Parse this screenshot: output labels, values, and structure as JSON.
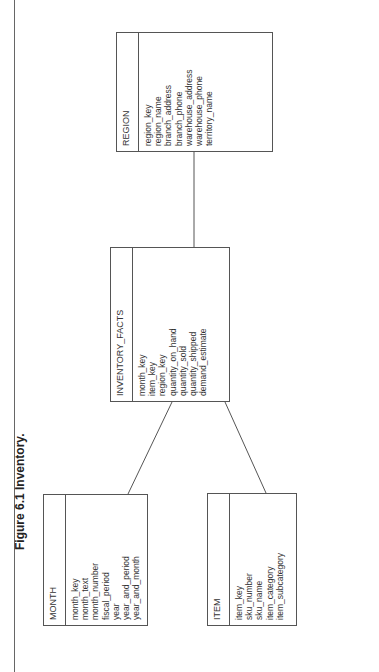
{
  "figure": {
    "title": "Figure 6.1 Inventory."
  },
  "entities": {
    "month": {
      "name": "MONTH",
      "attributes": [
        "month_key",
        "month_text",
        "month_number",
        "fiscal_period",
        "year",
        "year_and_period",
        "year_and_month"
      ]
    },
    "item": {
      "name": "ITEM",
      "attributes": [
        "item_key",
        "sku_number",
        "sku_name",
        "item_category",
        "item_subcategory"
      ]
    },
    "inventory_facts": {
      "name": "INVENTORY_FACTS",
      "attributes": [
        "month_key",
        "item_key",
        "region_key",
        "quantity_on_hand",
        "quantity_sold",
        "quantity_shipped",
        "demand_estimate"
      ]
    },
    "region": {
      "name": "REGION",
      "attributes": [
        "region_key",
        "region_name",
        "branch_address",
        "branch_phone",
        "warehouse_address",
        "warehouse_phone",
        "territory_name"
      ]
    }
  },
  "relationships": [
    {
      "from": "MONTH",
      "to": "INVENTORY_FACTS"
    },
    {
      "from": "ITEM",
      "to": "INVENTORY_FACTS"
    },
    {
      "from": "REGION",
      "to": "INVENTORY_FACTS"
    }
  ],
  "colors": {
    "line": "#555555",
    "text": "#333333",
    "background": "#ffffff"
  }
}
